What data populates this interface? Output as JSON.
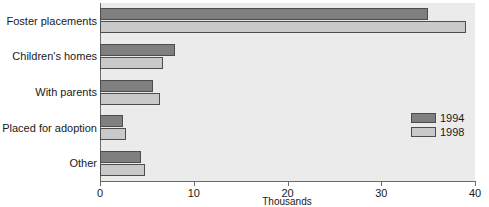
{
  "chart_data": {
    "type": "bar",
    "orientation": "horizontal",
    "title": "",
    "xlabel": "Thousands",
    "ylabel": "",
    "xlim": [
      0,
      40
    ],
    "xticks": [
      0,
      10,
      20,
      30,
      40
    ],
    "xtick_labels": [
      "0",
      "10",
      "20",
      "30",
      "40"
    ],
    "grid": false,
    "legend_position": "center-right",
    "categories": [
      "Foster placements",
      "Children's homes",
      "With parents",
      "Placed for adoption",
      "Other"
    ],
    "series": [
      {
        "name": "1994",
        "color": "#7f7f7f",
        "values": [
          35.0,
          8.0,
          5.6,
          2.4,
          4.4
        ]
      },
      {
        "name": "1998",
        "color": "#c9c9c9",
        "values": [
          39.0,
          6.7,
          6.4,
          2.8,
          4.8
        ]
      }
    ]
  },
  "legend": {
    "entries": [
      {
        "label": "1994",
        "swatch": "#7f7f7f"
      },
      {
        "label": "1998",
        "swatch": "#c9c9c9"
      }
    ]
  },
  "colors": {
    "series_1994": "#7f7f7f",
    "series_1998": "#c9c9c9",
    "plot_background": "#ebebeb",
    "page_background": "#ffffff",
    "axis": "#6b6b6b",
    "text": "#1a1a1a"
  }
}
